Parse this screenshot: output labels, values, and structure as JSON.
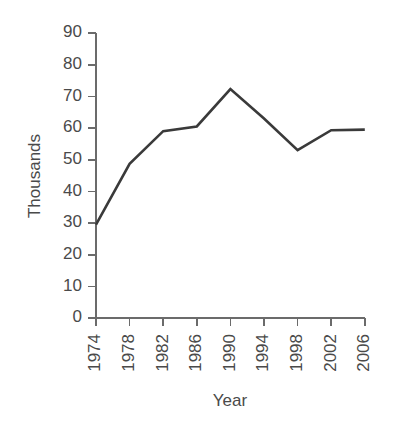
{
  "chart_data": {
    "type": "line",
    "title": "",
    "subtitle": "",
    "xlabel": "Year",
    "ylabel": "Thousands",
    "grid": false,
    "legend": "none",
    "x": [
      1974,
      1978,
      1982,
      1986,
      1990,
      1994,
      1998,
      2002,
      2006
    ],
    "xtick_labels": [
      "1974",
      "1978",
      "1982",
      "1986",
      "1990",
      "1994",
      "1998",
      "2002",
      "2006"
    ],
    "xtick_rotation": 90,
    "xlim": [
      1974,
      2006
    ],
    "ytick_labels": [
      "0",
      "10",
      "20",
      "30",
      "40",
      "50",
      "60",
      "70",
      "80",
      "90"
    ],
    "ytick_values": [
      0,
      10,
      20,
      30,
      40,
      50,
      60,
      70,
      80,
      90
    ],
    "ylim": [
      0,
      90
    ],
    "series": [
      {
        "name": "Thousands",
        "color": "#3a3a3a",
        "values": [
          29.5,
          48.7,
          59.0,
          60.5,
          72.3,
          63.0,
          53.0,
          59.3,
          59.5
        ]
      }
    ]
  },
  "axes": {
    "y_axis_title": "Thousands",
    "x_axis_title": "Year"
  }
}
